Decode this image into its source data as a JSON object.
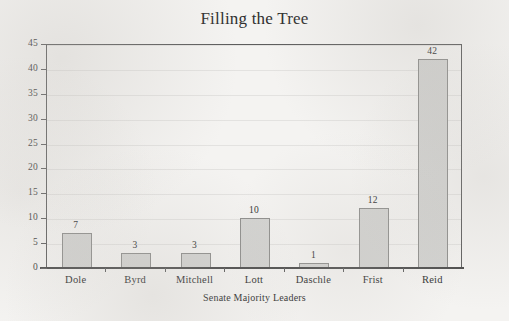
{
  "chart_data": {
    "type": "bar",
    "title": "Filling the Tree",
    "xlabel": "Senate Majority Leaders",
    "ylabel": "",
    "categories": [
      "Dole",
      "Byrd",
      "Mitchell",
      "Lott",
      "Daschle",
      "Frist",
      "Reid"
    ],
    "values": [
      7,
      3,
      3,
      10,
      1,
      12,
      42
    ],
    "value_labels": [
      "7",
      "3",
      "3",
      "10",
      "1",
      "12",
      "42"
    ],
    "ylim": [
      0,
      45
    ],
    "ytick_values": [
      0,
      5,
      10,
      15,
      20,
      25,
      30,
      35,
      40,
      45
    ],
    "ytick_labels": [
      "0",
      "5",
      "10",
      "15",
      "20",
      "25",
      "30",
      "35",
      "40",
      "45"
    ],
    "grid": true,
    "legend": "none",
    "colors": {
      "bar_fill": "#d3d3d1",
      "bar_border": "#8d8d8b",
      "axis": "#5d5d5d",
      "grid": "#e3e2e0",
      "text": "#2f2f2f",
      "background": "#f4f3f1"
    }
  }
}
